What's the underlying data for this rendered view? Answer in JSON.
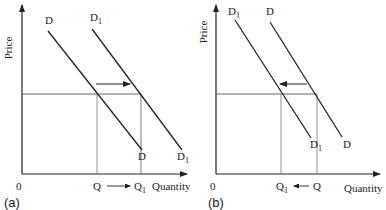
{
  "panels": [
    {
      "id": "a",
      "label": "(a)",
      "y_axis_label": "Price",
      "x_axis_label": "Quantity",
      "origin": "0",
      "curves": [
        {
          "name": "D",
          "label": "D",
          "sub": "",
          "end_label": "D",
          "end_sub": ""
        },
        {
          "name": "D1",
          "label": "D",
          "sub": "1",
          "end_label": "D",
          "end_sub": "1"
        }
      ],
      "quantities": {
        "q": "Q",
        "q_sub": "",
        "q1": "Q",
        "q1_sub": "1"
      },
      "shift_direction": "right"
    },
    {
      "id": "b",
      "label": "(b)",
      "y_axis_label": "Price",
      "x_axis_label": "Quantity",
      "origin": "0",
      "curves": [
        {
          "name": "D1",
          "label": "D",
          "sub": "1",
          "end_label": "D",
          "end_sub": "1"
        },
        {
          "name": "D",
          "label": "D",
          "sub": "",
          "end_label": "D",
          "end_sub": ""
        }
      ],
      "quantities": {
        "q1": "Q",
        "q1_sub": "1",
        "q": "Q",
        "q_sub": ""
      },
      "shift_direction": "left"
    }
  ],
  "colors": {
    "line": "#222222",
    "guide": "#555555"
  }
}
